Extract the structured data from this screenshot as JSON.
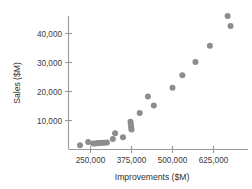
{
  "chart_data": {
    "type": "scatter",
    "title": "",
    "xlabel": "Improvements ($M)",
    "ylabel": "Sales ($M)",
    "xlim": [
      195000,
      700000
    ],
    "ylim": [
      0,
      49000
    ],
    "xticks": [
      250000,
      375000,
      500000,
      625000
    ],
    "xtick_labels": [
      "250,000",
      "375,000",
      "500,000",
      "625,000"
    ],
    "yticks": [
      10000,
      20000,
      30000,
      40000
    ],
    "ytick_labels": [
      "10,000",
      "20,000",
      "30,000",
      "40,000"
    ],
    "grid": false,
    "legend": null,
    "marker_color": "#8d8d90",
    "marker_size": 3.0,
    "points": [
      {
        "x": 218000,
        "y": 1500
      },
      {
        "x": 243000,
        "y": 2600
      },
      {
        "x": 258000,
        "y": 2100
      },
      {
        "x": 265000,
        "y": 2100
      },
      {
        "x": 272000,
        "y": 2200
      },
      {
        "x": 279000,
        "y": 2200
      },
      {
        "x": 286000,
        "y": 2300
      },
      {
        "x": 293000,
        "y": 2300
      },
      {
        "x": 300000,
        "y": 2400
      },
      {
        "x": 318000,
        "y": 3600
      },
      {
        "x": 325000,
        "y": 5600
      },
      {
        "x": 349000,
        "y": 4200
      },
      {
        "x": 372000,
        "y": 9600
      },
      {
        "x": 373000,
        "y": 8700
      },
      {
        "x": 374000,
        "y": 7600
      },
      {
        "x": 375000,
        "y": 6900
      },
      {
        "x": 400000,
        "y": 12600
      },
      {
        "x": 425000,
        "y": 18300
      },
      {
        "x": 443000,
        "y": 15200
      },
      {
        "x": 500000,
        "y": 21300
      },
      {
        "x": 530000,
        "y": 25600
      },
      {
        "x": 570000,
        "y": 30200
      },
      {
        "x": 614000,
        "y": 35800
      },
      {
        "x": 668000,
        "y": 46000
      },
      {
        "x": 677000,
        "y": 42600
      }
    ]
  },
  "axes": {
    "x_title": "Improvements ($M)",
    "y_title": "Sales ($M)"
  }
}
